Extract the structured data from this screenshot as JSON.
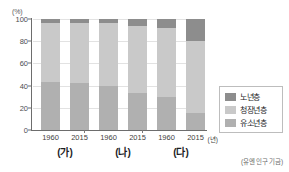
{
  "chart_data": {
    "type": "bar",
    "subtype": "stacked-column-100",
    "title": "",
    "xlabel": "",
    "ylabel": "(%)",
    "yunit": "(%)",
    "xunit": "(년)",
    "ylim": [
      0,
      100
    ],
    "yticks": [
      0,
      20,
      40,
      60,
      80,
      100
    ],
    "ytick_labels": [
      "0",
      "20",
      "40",
      "60",
      "80",
      "100"
    ],
    "grid": true,
    "legend_position": "right",
    "source": "(유엔 인구 기금)",
    "groups": [
      {
        "label": "(가)",
        "years": [
          "1960",
          "2015"
        ]
      },
      {
        "label": "(나)",
        "years": [
          "1960",
          "2015"
        ]
      },
      {
        "label": "(다)",
        "years": [
          "1960",
          "2015"
        ]
      }
    ],
    "categories": [
      "(가) 1960",
      "(가) 2015",
      "(나) 1960",
      "(나) 2015",
      "(다) 1960",
      "(다) 2015"
    ],
    "series": [
      {
        "name": "유소년층",
        "color": "#b0b0b0",
        "values": [
          43,
          42,
          40,
          33,
          30,
          15
        ]
      },
      {
        "name": "청장년층",
        "color": "#c9c9c9",
        "values": [
          53,
          54,
          56,
          61,
          62,
          65
        ]
      },
      {
        "name": "노년층",
        "color": "#8d8d8d",
        "values": [
          4,
          4,
          4,
          6,
          8,
          20
        ]
      }
    ],
    "bars": [
      {
        "category": "(가) 1960",
        "group": "(가)",
        "year": "1960",
        "youth": 43,
        "working": 53,
        "elder": 4
      },
      {
        "category": "(가) 2015",
        "group": "(가)",
        "year": "2015",
        "youth": 42,
        "working": 54,
        "elder": 4
      },
      {
        "category": "(나) 1960",
        "group": "(나)",
        "year": "1960",
        "youth": 40,
        "working": 56,
        "elder": 4
      },
      {
        "category": "(나) 2015",
        "group": "(나)",
        "year": "2015",
        "youth": 33,
        "working": 61,
        "elder": 6
      },
      {
        "category": "(다) 1960",
        "group": "(다)",
        "year": "1960",
        "youth": 30,
        "working": 62,
        "elder": 8
      },
      {
        "category": "(다) 2015",
        "group": "(다)",
        "year": "2015",
        "youth": 15,
        "working": 65,
        "elder": 20
      }
    ]
  },
  "legend": {
    "items": [
      {
        "label": "노년층",
        "color": "#8d8d8d"
      },
      {
        "label": "청장년층",
        "color": "#c9c9c9"
      },
      {
        "label": "유소년층",
        "color": "#b0b0b0"
      }
    ]
  },
  "axis": {
    "unit_label": "(%)",
    "x_unit": "(년)"
  },
  "footer": {
    "source": "(유엔 인구 기금)"
  },
  "colors": {
    "elder": "#8d8d8d",
    "working": "#c9c9c9",
    "youth": "#b0b0b0",
    "grid": "#e2e2e2",
    "axis": "#6d6d6d",
    "text": "#3f3f41",
    "background": "#ffffff"
  }
}
